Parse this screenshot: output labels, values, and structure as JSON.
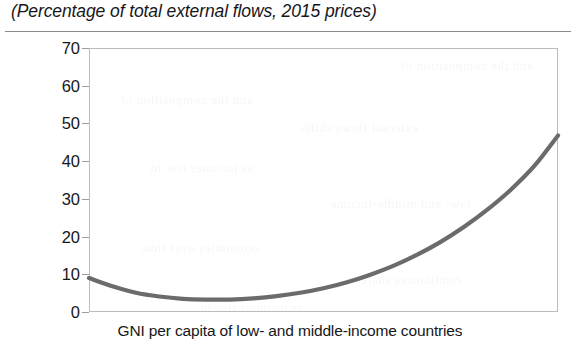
{
  "title": "(Percentage of total external flows, 2015 prices)",
  "axis": {
    "x_caption": "GNI per capita of low- and middle-income countries",
    "y_tick_labels": [
      "70",
      "60",
      "50",
      "40",
      "30",
      "20",
      "10",
      "0"
    ]
  },
  "style": {
    "line_color": "#6b6b6b",
    "frame_color": "#b9bcc0",
    "rule_color": "#8a8d92",
    "text_color": "#17171a"
  },
  "bleed_text": [
    "and the composition of",
    "external flows shifts",
    "as incomes rise in",
    "low- and middle-income",
    "economies over time",
    "remittances share"
  ],
  "chart_data": {
    "type": "line",
    "title": "(Percentage of total external flows, 2015 prices)",
    "xlabel": "GNI per capita of low- and middle-income countries",
    "ylabel": "",
    "xlim": [
      0,
      100
    ],
    "ylim": [
      0,
      70
    ],
    "yticks": [
      0,
      10,
      20,
      30,
      40,
      50,
      60,
      70
    ],
    "xticks": [],
    "grid": false,
    "legend": false,
    "series": [
      {
        "name": "Share of total external flows",
        "x": [
          0,
          5,
          10,
          15,
          20,
          25,
          30,
          35,
          40,
          45,
          50,
          55,
          60,
          65,
          70,
          75,
          80,
          85,
          90,
          95,
          100
        ],
        "values": [
          9.0,
          6.8,
          5.1,
          4.1,
          3.5,
          3.3,
          3.3,
          3.6,
          4.2,
          5.1,
          6.3,
          7.9,
          9.9,
          12.3,
          15.2,
          18.6,
          22.6,
          27.2,
          32.5,
          38.8,
          46.8
        ]
      }
    ]
  }
}
